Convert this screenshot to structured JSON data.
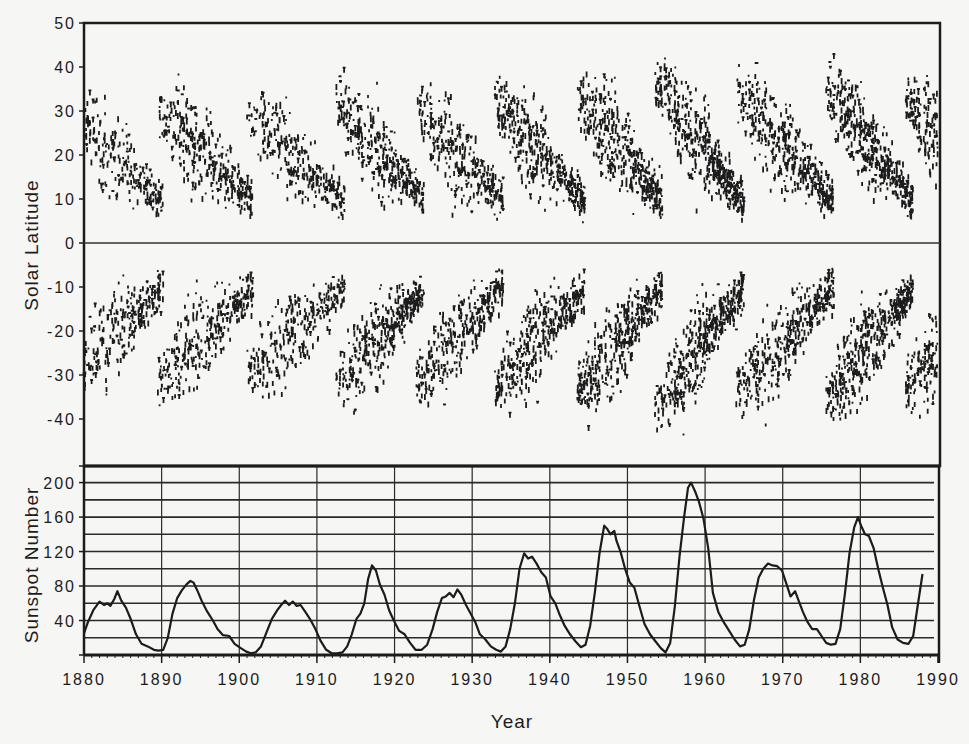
{
  "figure": {
    "background": "#f6f6f4",
    "ink": "#1c1c1c"
  },
  "chart_data": [
    {
      "type": "scatter",
      "name": "butterfly-diagram",
      "title": "",
      "xlabel": "",
      "ylabel": "Solar Latitude",
      "xlim": [
        1880,
        1990
      ],
      "ylim": [
        -50,
        50
      ],
      "yticks": [
        50,
        40,
        30,
        20,
        10,
        0,
        -10,
        -20,
        -30,
        -40
      ],
      "ytick_labels": [
        "50",
        "40",
        "30",
        "20",
        "10",
        "0",
        "-10",
        "-20",
        "-30",
        "-40"
      ],
      "reference_line": 0,
      "grid": false,
      "description": "Sunspot latitude vs time; each solar cycle forms a pair of wing-shaped bands starting near ±30° and drifting toward the equator.",
      "cycles": [
        {
          "start": 1878.9,
          "end": 1890.2,
          "max_lat": 30,
          "strength": 0.55
        },
        {
          "start": 1889.5,
          "end": 1901.8,
          "max_lat": 33,
          "strength": 0.7
        },
        {
          "start": 1901.0,
          "end": 1913.6,
          "max_lat": 31,
          "strength": 0.6
        },
        {
          "start": 1912.5,
          "end": 1923.8,
          "max_lat": 34,
          "strength": 0.8
        },
        {
          "start": 1922.8,
          "end": 1934.0,
          "max_lat": 33,
          "strength": 0.7
        },
        {
          "start": 1932.9,
          "end": 1944.5,
          "max_lat": 35,
          "strength": 0.85
        },
        {
          "start": 1943.5,
          "end": 1954.5,
          "max_lat": 36,
          "strength": 0.9
        },
        {
          "start": 1953.5,
          "end": 1965.0,
          "max_lat": 40,
          "strength": 1.0
        },
        {
          "start": 1964.0,
          "end": 1976.6,
          "max_lat": 37,
          "strength": 0.85
        },
        {
          "start": 1975.6,
          "end": 1986.8,
          "max_lat": 38,
          "strength": 0.95
        },
        {
          "start": 1985.8,
          "end": 1996.5,
          "max_lat": 36,
          "strength": 0.9
        }
      ]
    },
    {
      "type": "line",
      "name": "sunspot-number",
      "title": "",
      "xlabel": "Year",
      "ylabel": "Sunspot Number",
      "xlim": [
        1880,
        1990
      ],
      "ylim": [
        0,
        220
      ],
      "xticks": [
        1880,
        1890,
        1900,
        1910,
        1920,
        1930,
        1940,
        1950,
        1960,
        1970,
        1980,
        1990
      ],
      "xtick_labels": [
        "1880",
        "1890",
        "1900",
        "1910",
        "1920",
        "1930",
        "1940",
        "1950",
        "1960",
        "1970",
        "1980",
        "1990"
      ],
      "yticks": [
        40,
        80,
        120,
        160,
        200
      ],
      "ytick_labels": [
        "40",
        "80",
        "120",
        "160",
        "200"
      ],
      "grid": true,
      "grid_y_step": 20,
      "grid_x_step": 10,
      "series": [
        {
          "name": "Smoothed sunspot number",
          "x": [
            1880.0,
            1880.5,
            1881.2,
            1882.0,
            1882.6,
            1883.0,
            1883.4,
            1883.9,
            1884.3,
            1884.8,
            1885.4,
            1886.0,
            1886.7,
            1887.4,
            1888.2,
            1889.0,
            1889.6,
            1890.2,
            1890.8,
            1891.4,
            1892.0,
            1892.6,
            1893.2,
            1893.7,
            1894.1,
            1894.6,
            1895.2,
            1895.9,
            1896.6,
            1897.2,
            1897.9,
            1898.7,
            1899.4,
            1900.2,
            1900.9,
            1901.5,
            1902.1,
            1902.8,
            1903.5,
            1904.2,
            1904.9,
            1905.4,
            1905.9,
            1906.4,
            1906.9,
            1907.4,
            1907.9,
            1908.5,
            1909.1,
            1909.8,
            1910.5,
            1911.2,
            1911.9,
            1912.6,
            1913.3,
            1913.9,
            1914.5,
            1915.1,
            1915.6,
            1916.1,
            1916.6,
            1917.1,
            1917.6,
            1918.1,
            1918.7,
            1919.3,
            1919.9,
            1920.6,
            1921.3,
            1922.0,
            1922.7,
            1923.5,
            1924.2,
            1924.9,
            1925.5,
            1926.1,
            1926.6,
            1927.1,
            1927.6,
            1928.1,
            1928.6,
            1929.2,
            1929.8,
            1930.4,
            1931.0,
            1931.7,
            1932.4,
            1933.1,
            1933.7,
            1934.3,
            1934.9,
            1935.5,
            1936.1,
            1936.7,
            1937.2,
            1937.7,
            1938.3,
            1938.9,
            1939.5,
            1940.1,
            1940.7,
            1941.3,
            1941.9,
            1942.6,
            1943.3,
            1944.0,
            1944.6,
            1945.2,
            1945.8,
            1946.4,
            1947.0,
            1947.4,
            1947.8,
            1948.3,
            1948.6,
            1949.1,
            1949.7,
            1950.3,
            1950.9,
            1951.5,
            1952.2,
            1952.9,
            1953.6,
            1954.3,
            1954.9,
            1955.5,
            1956.1,
            1956.7,
            1957.3,
            1957.8,
            1958.2,
            1958.7,
            1959.2,
            1959.8,
            1960.4,
            1961.0,
            1961.7,
            1962.4,
            1963.1,
            1963.8,
            1964.5,
            1965.1,
            1965.7,
            1966.3,
            1966.9,
            1967.5,
            1968.1,
            1968.7,
            1969.3,
            1969.9,
            1970.5,
            1971.0,
            1971.6,
            1972.1,
            1972.6,
            1973.2,
            1973.8,
            1974.4,
            1975.0,
            1975.6,
            1976.2,
            1976.8,
            1977.4,
            1978.0,
            1978.6,
            1979.2,
            1979.7,
            1980.1,
            1980.6,
            1981.1,
            1981.7,
            1982.3,
            1982.9,
            1983.5,
            1984.1,
            1984.8,
            1985.5,
            1986.2,
            1986.8,
            1987.4,
            1988.0,
            1988.6,
            1989.2
          ],
          "y": [
            25,
            38,
            52,
            62,
            58,
            60,
            57,
            65,
            74,
            63,
            55,
            42,
            24,
            13,
            10,
            6,
            5,
            6,
            20,
            48,
            66,
            75,
            82,
            86,
            84,
            75,
            62,
            50,
            40,
            30,
            23,
            22,
            13,
            8,
            4,
            2,
            3,
            10,
            26,
            42,
            52,
            58,
            63,
            58,
            62,
            57,
            58,
            50,
            42,
            30,
            16,
            6,
            2,
            2,
            3,
            10,
            24,
            42,
            48,
            60,
            88,
            104,
            98,
            82,
            70,
            52,
            40,
            28,
            24,
            14,
            6,
            6,
            12,
            30,
            50,
            66,
            68,
            72,
            67,
            76,
            70,
            58,
            48,
            38,
            24,
            18,
            10,
            6,
            4,
            10,
            30,
            60,
            100,
            118,
            112,
            114,
            106,
            96,
            90,
            68,
            60,
            46,
            34,
            24,
            16,
            9,
            12,
            34,
            72,
            118,
            150,
            146,
            140,
            144,
            132,
            120,
            100,
            84,
            78,
            58,
            36,
            24,
            16,
            8,
            3,
            14,
            56,
            114,
            160,
            194,
            200,
            190,
            178,
            158,
            124,
            72,
            50,
            38,
            28,
            18,
            10,
            12,
            30,
            64,
            90,
            100,
            106,
            104,
            103,
            98,
            82,
            68,
            74,
            62,
            50,
            38,
            30,
            30,
            22,
            14,
            12,
            13,
            30,
            70,
            118,
            148,
            160,
            150,
            140,
            138,
            124,
            100,
            78,
            58,
            32,
            18,
            14,
            13,
            22,
            58,
            94
          ]
        }
      ]
    }
  ]
}
